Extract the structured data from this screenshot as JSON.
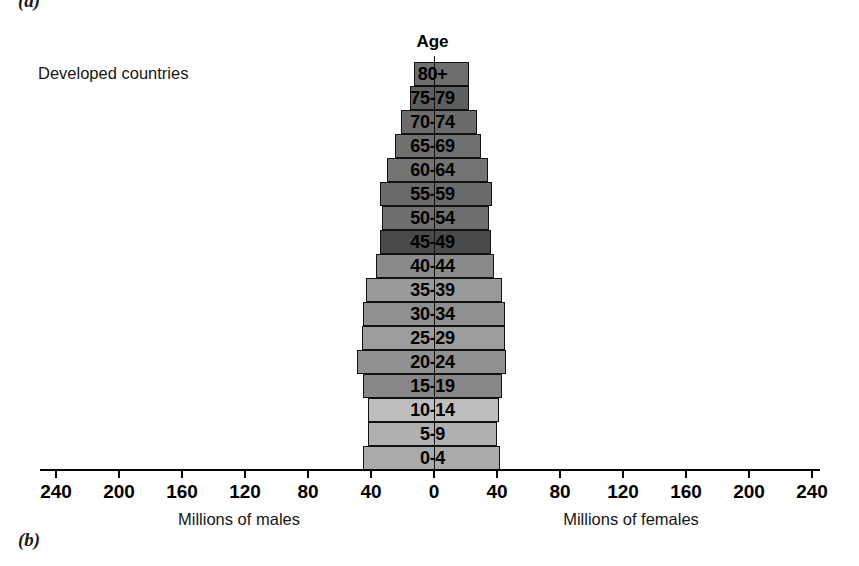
{
  "figure": {
    "part_label_a": "(a)",
    "part_label_b": "(b)"
  },
  "chart_data": {
    "type": "bar",
    "subtype": "population-pyramid",
    "title": "Developed countries",
    "center_heading": "Age",
    "xlabel_left": "Millions of males",
    "xlabel_right": "Millions of females",
    "ylabel": "Age",
    "grid": false,
    "legend": "none",
    "axis_max": 240,
    "axis_tick_step": 40,
    "tick_labels_left": [
      "240",
      "200",
      "160",
      "120",
      "80",
      "40"
    ],
    "tick_label_center": "0",
    "tick_labels_right": [
      "40",
      "80",
      "120",
      "160",
      "200",
      "240"
    ],
    "units": "millions",
    "categories": [
      "80+",
      "75-79",
      "70-74",
      "65-69",
      "60-64",
      "55-59",
      "50-54",
      "45-49",
      "40-44",
      "35-39",
      "30-34",
      "25-29",
      "20-24",
      "15-19",
      "10-14",
      "5-9",
      "0-4"
    ],
    "series": [
      {
        "name": "Millions of males",
        "side": "left",
        "values": [
          13,
          15,
          21,
          25,
          30,
          34,
          33,
          34,
          37,
          43,
          45,
          46,
          49,
          45,
          42,
          42,
          45
        ]
      },
      {
        "name": "Millions of females",
        "side": "right",
        "values": [
          22,
          22,
          27,
          30,
          34,
          37,
          35,
          36,
          38,
          43,
          45,
          45,
          46,
          43,
          41,
          40,
          42
        ]
      }
    ],
    "bar_fills": [
      "#6e6e6e",
      "#5f5f5f",
      "#6b6b6b",
      "#707070",
      "#747474",
      "#6a6a6a",
      "#6f6f6f",
      "#4a4a4a",
      "#8a8a8a",
      "#9a9a9a",
      "#8f8f8f",
      "#9d9d9d",
      "#909090",
      "#878787",
      "#bdbdbd",
      "#b0b0b0",
      "#aaaaaa"
    ],
    "bar_row_labels": [
      "80+",
      "75-79",
      "70-74",
      "65-69",
      "60-64",
      "55-59",
      "50-54",
      "45-49",
      "40-44",
      "35-39",
      "30-34",
      "25-29",
      "20-24",
      "15-19",
      "10-14",
      "5-9",
      "0-4"
    ]
  },
  "layout": {
    "zero_x_px": 434,
    "px_per_million": 1.575,
    "row_height_px": 24,
    "first_row_top_px": 62
  }
}
